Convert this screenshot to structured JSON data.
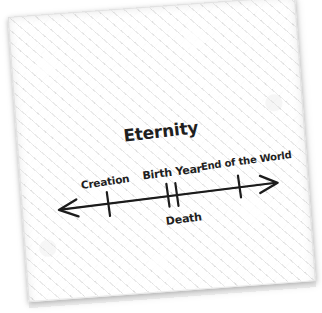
{
  "image": {
    "subject": "hand-drawn timeline on a paper napkin",
    "background_color": "#ffffff",
    "napkin_color": "#f7f7f7",
    "ink_color": "#1c1c1c",
    "napkin_rotation_deg": -4.2
  },
  "drawing": {
    "title": "Eternity",
    "axis": {
      "left_arrow": "left-arrowhead",
      "right_arrow": "right-arrowhead",
      "direction": "bidirectional"
    },
    "labels_above": [
      {
        "text": "Creation",
        "tick_index": 0
      },
      {
        "text": "Birth Year",
        "tick_index": 1
      },
      {
        "text": "End of the World",
        "tick_index": 3
      }
    ],
    "labels_below": [
      {
        "text": "Death",
        "tick_index": 2
      }
    ],
    "ticks": [
      {
        "name": "creation-tick",
        "label": "Creation"
      },
      {
        "name": "birth-year-tick",
        "label": "Birth Year"
      },
      {
        "name": "death-tick",
        "label": "Death"
      },
      {
        "name": "end-of-world-tick",
        "label": "End of the World"
      }
    ]
  }
}
